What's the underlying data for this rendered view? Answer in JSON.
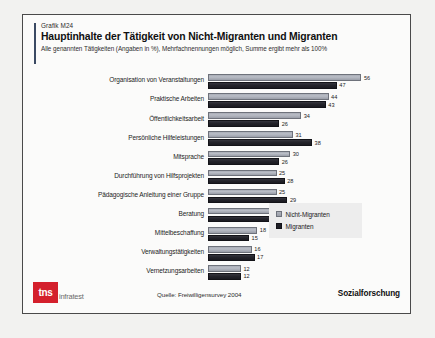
{
  "header": {
    "grafik_id": "Grafik M24",
    "title": "Hauptinhalte der Tätigkeit von Nicht-Migranten und Migranten",
    "subtitle": "Alle genannten Tätigkeiten (Angaben in %), Mehrfachnennungen möglich, Summe ergibt mehr als 100%"
  },
  "legend": {
    "items": [
      {
        "label": "Nicht-Migranten",
        "color": "#aeb2bb"
      },
      {
        "label": "Migranten",
        "color": "#1f1f26"
      }
    ]
  },
  "footer": {
    "logo_mark": "tns",
    "logo_word": "infratest",
    "source": "Quelle: Freiwilligensurvey 2004",
    "division": "Sozialforschung"
  },
  "chart_data": {
    "type": "bar",
    "orientation": "horizontal",
    "title": "Hauptinhalte der Tätigkeit von Nicht-Migranten und Migranten",
    "subtitle": "Alle genannten Tätigkeiten (Angaben in %), Mehrfachnennungen möglich, Summe ergibt mehr als 100%",
    "xlabel": "",
    "ylabel": "",
    "unit": "%",
    "xlim": [
      0,
      56
    ],
    "grid": false,
    "legend_position": "right",
    "categories": [
      "Organisation von Veranstaltungen",
      "Praktische Arbeiten",
      "Öffentlichkeitsarbeit",
      "Persönliche Hilfeleistungen",
      "Mitsprache",
      "Durchführung von Hilfsprojekten",
      "Pädagogische Anleitung einer Gruppe",
      "Beratung",
      "Mittelbeschaffung",
      "Verwaltungstätigkeiten",
      "Vernetzungsarbeiten"
    ],
    "series": [
      {
        "name": "Nicht-Migranten",
        "color": "#aeb2bb",
        "values": [
          56,
          44,
          34,
          31,
          30,
          25,
          25,
          25,
          18,
          16,
          12
        ]
      },
      {
        "name": "Migranten",
        "color": "#1f1f26",
        "values": [
          47,
          43,
          26,
          38,
          26,
          28,
          29,
          26,
          15,
          17,
          12
        ]
      }
    ]
  }
}
